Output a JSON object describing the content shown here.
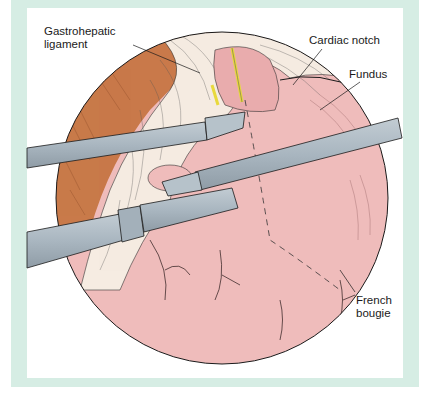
{
  "figure": {
    "type": "surgical-illustration",
    "view": "circular laparoscopic view",
    "labels": {
      "gastrohepatic_line1": "Gastrohepatic",
      "gastrohepatic_line2": "ligament",
      "cardiac_notch": "Cardiac notch",
      "fundus": "Fundus",
      "french_line1": "French",
      "french_line2": "bougie"
    },
    "colors": {
      "frame": "#d6ede4",
      "panel": "#ffffff",
      "stomach": "#efbcbb",
      "liver": "#c97a4a",
      "omentum": "#f6ece2",
      "instrument": "#a9b6c0",
      "nerve": "#f2e64a",
      "outline": "#1a1a1a"
    },
    "instruments": [
      {
        "name": "upper-left grasper"
      },
      {
        "name": "right grasper"
      },
      {
        "name": "lower-left stapler"
      }
    ]
  }
}
